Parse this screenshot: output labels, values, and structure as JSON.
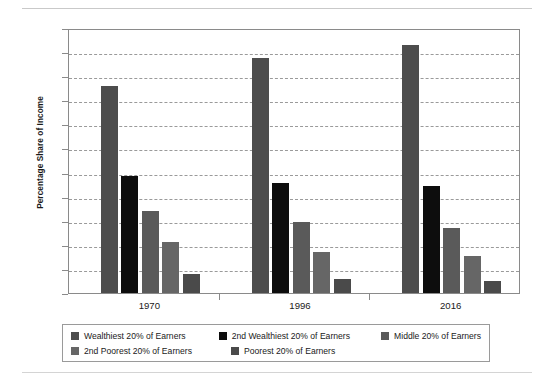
{
  "chart_data": {
    "type": "bar",
    "title": "",
    "subtitle": "",
    "xlabel": "",
    "ylabel": "Percentage Share of Income",
    "categories": [
      "1970",
      "1996",
      "2016"
    ],
    "ylim": [
      0,
      55
    ],
    "ytick_labels": [
      "0%",
      "5%",
      "10%",
      "15%",
      "20%",
      "25%",
      "30%",
      "35%",
      "40%",
      "45%",
      "50%",
      "55%"
    ],
    "ytick_values": [
      0,
      5,
      10,
      15,
      20,
      25,
      30,
      35,
      40,
      45,
      50,
      55
    ],
    "grid": "horizontal-dashed",
    "legend_position": "bottom",
    "series": [
      {
        "name": "Wealthiest 20% of Earners",
        "color": "#4d4d4d",
        "values": [
          43.0,
          48.7,
          51.5
        ]
      },
      {
        "name": "2nd Wealthiest 20% of Earners",
        "color": "#0d0d0d",
        "values": [
          24.2,
          22.8,
          22.3
        ]
      },
      {
        "name": "Middle 20% of Earners",
        "color": "#5a5a5a",
        "values": [
          17.1,
          14.8,
          13.5
        ]
      },
      {
        "name": "2nd Poorest 20% of Earners",
        "color": "#666666",
        "values": [
          10.6,
          8.5,
          7.7
        ]
      },
      {
        "name": "Poorest 20% of Earners",
        "color": "#4a4a4a",
        "values": [
          4.0,
          3.0,
          2.5
        ]
      }
    ]
  },
  "legend": {
    "row1": [
      {
        "label": "Wealthiest 20% of Earners",
        "color": "#4d4d4d"
      },
      {
        "label": "2nd Wealthiest 20% of Earners",
        "color": "#0d0d0d"
      },
      {
        "label": "Middle 20% of Earners",
        "color": "#5a5a5a"
      }
    ],
    "row2": [
      {
        "label": "2nd Poorest 20% of Earners",
        "color": "#666666"
      },
      {
        "label": "Poorest 20% of Earners",
        "color": "#4a4a4a"
      }
    ]
  }
}
